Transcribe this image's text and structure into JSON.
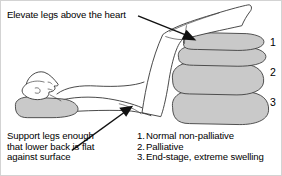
{
  "figure": {
    "callout_top": "Elevate legs above the heart",
    "callout_bottom": {
      "line1": "Support legs enough",
      "line2": "that lower back is flat",
      "line3": "against surface"
    },
    "stack_markers": {
      "m1": "1",
      "m2": "2",
      "m3": "3"
    },
    "legend": [
      {
        "num": "1.",
        "label": "Normal non-palliative"
      },
      {
        "num": "2.",
        "label": "Palliative"
      },
      {
        "num": "3.",
        "label": "End-stage, extreme swelling"
      }
    ],
    "colors": {
      "pillow_fill": "#c9c9c9",
      "outline": "#333333",
      "text": "#000000",
      "background": "#ffffff",
      "border": "#d3d3d3"
    }
  }
}
